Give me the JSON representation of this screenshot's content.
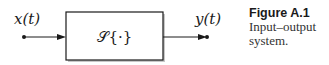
{
  "diagram": {
    "input_label": "x(t)",
    "output_label": "y(t)",
    "system_label": "𝒮{·}",
    "nodes": [
      {
        "id": "input",
        "label": "x(t)",
        "type": "terminal"
      },
      {
        "id": "system",
        "label": "𝒮{·}",
        "type": "block"
      },
      {
        "id": "output",
        "label": "y(t)",
        "type": "terminal"
      }
    ],
    "edges": [
      {
        "from": "input",
        "to": "system"
      },
      {
        "from": "system",
        "to": "output"
      }
    ]
  },
  "caption": {
    "figure_number": "Figure A.1",
    "line1": "Input–output",
    "line2": "system."
  },
  "colors": {
    "stroke": "#1a1a1a",
    "shadow": "#bdbdbd"
  }
}
